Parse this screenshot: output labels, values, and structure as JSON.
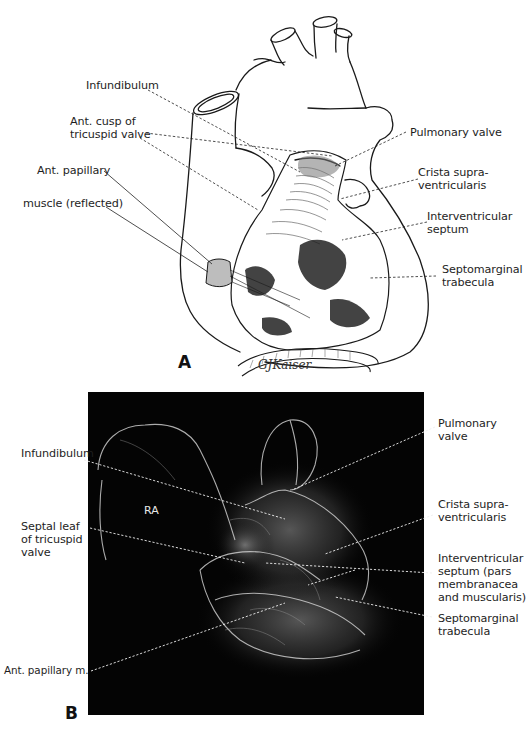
{
  "figure": {
    "panel_a": {
      "letter": "A",
      "signature": "GJKaiser",
      "labels_left": [
        {
          "text": "Infundibulum"
        },
        {
          "text": "Ant. cusp of",
          "line2": "tricuspid valve"
        },
        {
          "text": "Ant. papillary"
        },
        {
          "text": "muscle (reflected)"
        }
      ],
      "labels_right": [
        {
          "text": "Pulmonary valve"
        },
        {
          "text": "Crista supra-",
          "line2": "ventricularis"
        },
        {
          "text": "Interventricular",
          "line2": "septum"
        },
        {
          "text": "Septomarginal",
          "line2": "trabecula"
        }
      ]
    },
    "panel_b": {
      "letter": "B",
      "inner_label": "RA",
      "labels_left": [
        {
          "text": "Infundibulum"
        },
        {
          "text": "Septal leaf",
          "line2": "of tricuspid",
          "line3": "valve"
        },
        {
          "text": "Ant. papillary m."
        }
      ],
      "labels_right": [
        {
          "text": "Pulmonary",
          "line2": "valve"
        },
        {
          "text": "Crista supra-",
          "line2": "ventricularis"
        },
        {
          "text": "Interventricular",
          "line2": "septum (pars",
          "line3": "membranacea",
          "line4": "and muscularis)"
        },
        {
          "text": "Septomarginal",
          "line2": "trabecula"
        }
      ]
    },
    "colors": {
      "background": "#ffffff",
      "ink": "#1e1e1e",
      "panel_b_background": "#040404",
      "panel_b_structure": "#cfcfcf"
    }
  }
}
